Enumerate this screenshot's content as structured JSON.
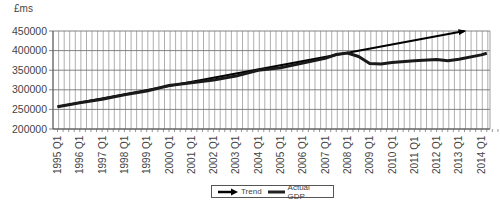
{
  "chart_data": {
    "type": "line",
    "title": "",
    "ylabel": "£ms",
    "xlabel": "",
    "ylim": [
      200000,
      450000
    ],
    "yticks": [
      200000,
      250000,
      300000,
      350000,
      400000,
      450000
    ],
    "ytick_labels": [
      "200000",
      "250000",
      "300000",
      "350000",
      "400000",
      "450000"
    ],
    "categories": [
      "1995 Q1",
      "1996 Q1",
      "1997 Q1",
      "1998 Q1",
      "1999 Q1",
      "2000 Q1",
      "2001 Q1",
      "2002 Q1",
      "2003 Q1",
      "2004 Q1",
      "2005 Q1",
      "2006 Q1",
      "2007 Q1",
      "2008 Q1",
      "2009 Q1",
      "2010 Q1",
      "2011 Q1",
      "2012 Q1",
      "2013 Q1",
      "2014 Q1"
    ],
    "grid": true,
    "legend_position": "bottom",
    "series": [
      {
        "name": "Trend",
        "style": "arrow",
        "x": [
          1995.0,
          2013.25
        ],
        "values": [
          257000,
          450000
        ]
      },
      {
        "name": "Actual GDP",
        "style": "line",
        "x": [
          1995.0,
          1996.0,
          1997.0,
          1998.0,
          1999.0,
          2000.0,
          2001.0,
          2002.0,
          2003.0,
          2004.0,
          2005.0,
          2006.0,
          2007.0,
          2007.5,
          2008.0,
          2008.5,
          2009.0,
          2009.5,
          2010.0,
          2011.0,
          2012.0,
          2012.5,
          2013.0,
          2014.0,
          2014.25
        ],
        "values": [
          257000,
          267000,
          276000,
          287000,
          297000,
          311000,
          318000,
          325000,
          335000,
          350000,
          356000,
          368000,
          380000,
          390000,
          394000,
          385000,
          367000,
          366000,
          370000,
          374000,
          377000,
          374000,
          378000,
          389000,
          393000
        ]
      }
    ]
  },
  "legend": {
    "trend_label": "Trend",
    "actual_label": "Actual GDP"
  },
  "axis": {
    "unit_label": "£ms"
  }
}
